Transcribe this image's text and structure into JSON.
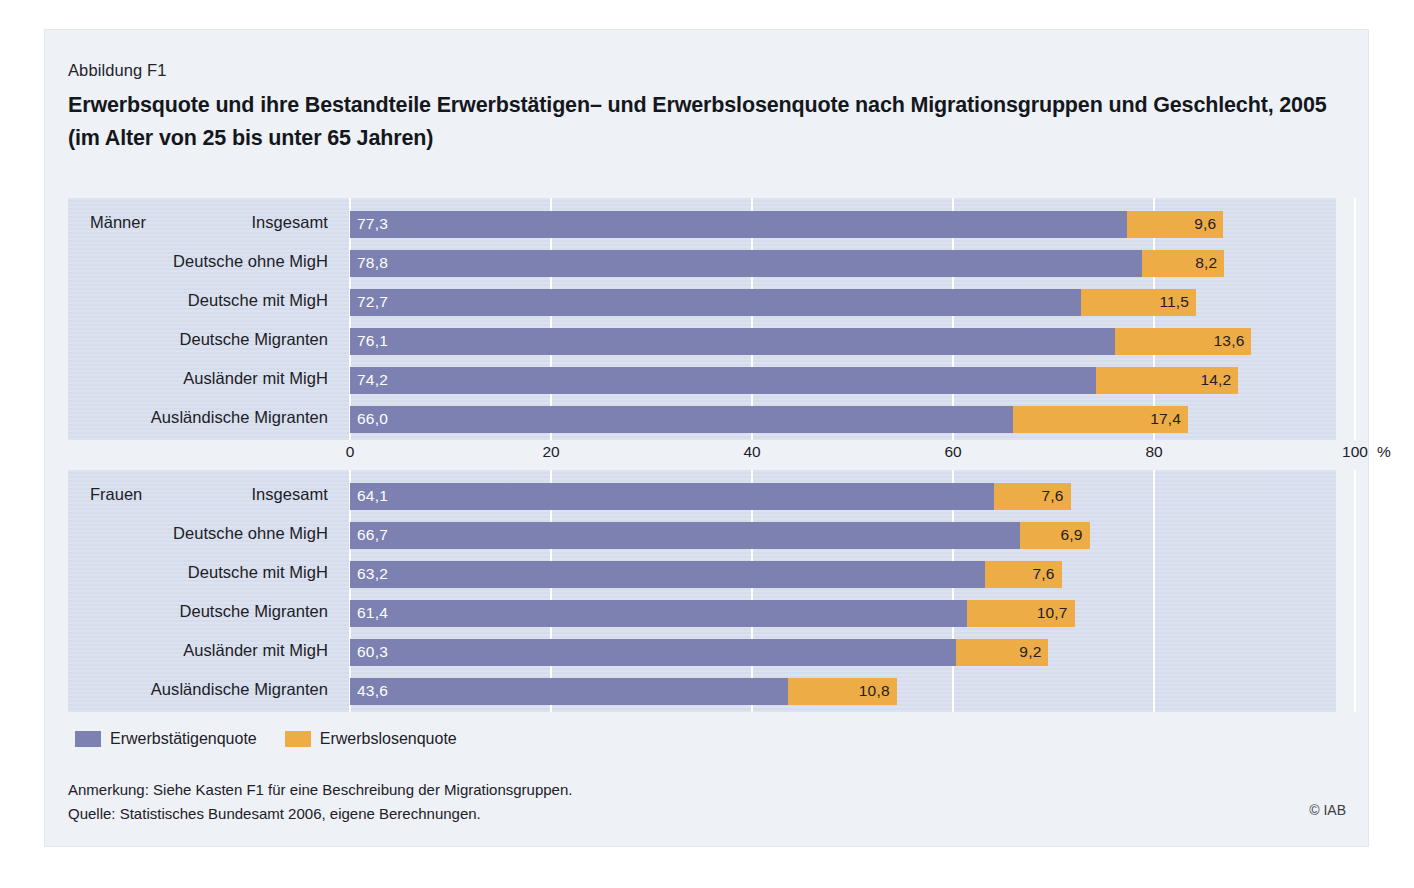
{
  "figure": {
    "number": "Abbildung F1",
    "title": "Erwerbsquote und ihre Bestandteile Erwerbstätigen– und Erwerbslosenquote nach Migrationsgruppen und Geschlecht, 2005 (im Alter von 25 bis unter 65 Jahren)",
    "credit": "© IAB"
  },
  "notes": {
    "line1": "Anmerkung: Siehe Kasten F1 für eine Beschreibung der Migrationsgruppen.",
    "line2": "Quelle: Statistisches Bundesamt 2006, eigene Berechnungen."
  },
  "legend": {
    "items": [
      {
        "label": "Erwerbstätigenquote",
        "color": "#7d81b2"
      },
      {
        "label": "Erwerbslosenquote",
        "color": "#edac46"
      }
    ]
  },
  "chart_data": {
    "type": "bar",
    "orientation": "horizontal",
    "stacked": true,
    "title": "Erwerbsquote und ihre Bestandteile Erwerbstätigen– und Erwerbslosenquote nach Migrationsgruppen und Geschlecht, 2005 (im Alter von 25 bis unter 65 Jahren)",
    "xlabel": "%",
    "ylabel": "",
    "xlim": [
      0,
      100
    ],
    "xticks": [
      0,
      20,
      40,
      60,
      80,
      100
    ],
    "xticklabels": [
      "0",
      "20",
      "40",
      "60",
      "80",
      "100"
    ],
    "x_unit_label": "%",
    "grid": true,
    "legend_position": "bottom-left",
    "series": [
      {
        "name": "Erwerbstätigenquote",
        "color": "#7d81b2"
      },
      {
        "name": "Erwerbslosenquote",
        "color": "#edac46"
      }
    ],
    "groups": [
      {
        "name": "Männer",
        "categories": [
          "Insgesamt",
          "Deutsche ohne MigH",
          "Deutsche mit MigH",
          "Deutsche Migranten",
          "Ausländer mit MigH",
          "Ausländische Migranten"
        ],
        "rows": [
          {
            "label": "Insgesamt",
            "employed": 77.3,
            "unemployed": 9.6,
            "employed_text": "77,3",
            "unemployed_text": "9,6"
          },
          {
            "label": "Deutsche ohne MigH",
            "employed": 78.8,
            "unemployed": 8.2,
            "employed_text": "78,8",
            "unemployed_text": "8,2"
          },
          {
            "label": "Deutsche mit MigH",
            "employed": 72.7,
            "unemployed": 11.5,
            "employed_text": "72,7",
            "unemployed_text": "11,5"
          },
          {
            "label": "Deutsche Migranten",
            "employed": 76.1,
            "unemployed": 13.6,
            "employed_text": "76,1",
            "unemployed_text": "13,6"
          },
          {
            "label": "Ausländer mit MigH",
            "employed": 74.2,
            "unemployed": 14.2,
            "employed_text": "74,2",
            "unemployed_text": "14,2"
          },
          {
            "label": "Ausländische Migranten",
            "employed": 66.0,
            "unemployed": 17.4,
            "employed_text": "66,0",
            "unemployed_text": "17,4"
          }
        ]
      },
      {
        "name": "Frauen",
        "categories": [
          "Insgesamt",
          "Deutsche ohne MigH",
          "Deutsche mit MigH",
          "Deutsche Migranten",
          "Ausländer mit MigH",
          "Ausländische Migranten"
        ],
        "rows": [
          {
            "label": "Insgesamt",
            "employed": 64.1,
            "unemployed": 7.6,
            "employed_text": "64,1",
            "unemployed_text": "7,6"
          },
          {
            "label": "Deutsche ohne MigH",
            "employed": 66.7,
            "unemployed": 6.9,
            "employed_text": "66,7",
            "unemployed_text": "6,9"
          },
          {
            "label": "Deutsche mit MigH",
            "employed": 63.2,
            "unemployed": 7.6,
            "employed_text": "63,2",
            "unemployed_text": "7,6"
          },
          {
            "label": "Deutsche Migranten",
            "employed": 61.4,
            "unemployed": 10.7,
            "employed_text": "61,4",
            "unemployed_text": "10,7"
          },
          {
            "label": "Ausländer mit MigH",
            "employed": 60.3,
            "unemployed": 9.2,
            "employed_text": "60,3",
            "unemployed_text": "9,2"
          },
          {
            "label": "Ausländische Migranten",
            "employed": 43.6,
            "unemployed": 10.8,
            "employed_text": "43,6",
            "unemployed_text": "10,8"
          }
        ]
      }
    ]
  }
}
